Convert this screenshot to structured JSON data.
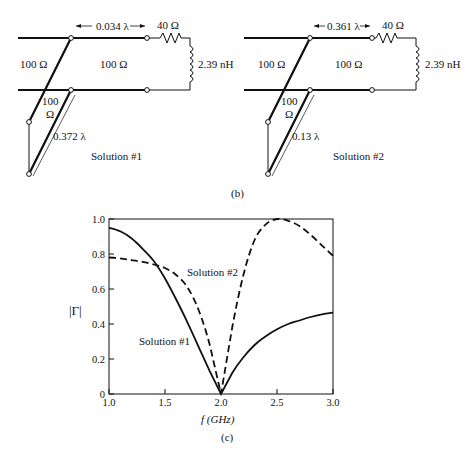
{
  "panel_b": {
    "caption": "(b)",
    "solutions": [
      {
        "label": "Solution #1",
        "line_impedance_left": "100 Ω",
        "line_impedance_right": "100 Ω",
        "stub_impedance_top": "100",
        "stub_impedance_bottom": "Ω",
        "series_length": "0.034 λ",
        "stub_length": "0.372 λ",
        "load_resistance": "40 Ω",
        "load_inductance": "2.39 nH"
      },
      {
        "label": "Solution #2",
        "line_impedance_left": "100 Ω",
        "line_impedance_right": "100 Ω",
        "stub_impedance_top": "100",
        "stub_impedance_bottom": "Ω",
        "series_length": "0.361 λ",
        "stub_length": "0.13 λ",
        "load_resistance": "40 Ω",
        "load_inductance": "2.39 nH"
      }
    ]
  },
  "panel_c": {
    "caption": "(c)",
    "ylabel": "|Γ|",
    "xlabel": "f (GHz)",
    "annotations": [
      "Solution #2",
      "Solution #1"
    ],
    "xticks": [
      "1.0",
      "1.5",
      "2.0",
      "2.5",
      "3.0"
    ],
    "yticks": [
      "0",
      "0.2",
      "0.4",
      "0.6",
      "0.8",
      "1.0"
    ]
  },
  "chart_data": {
    "type": "line",
    "title": "",
    "xlabel": "f (GHz)",
    "ylabel": "|Γ|",
    "xlim": [
      1.0,
      3.0
    ],
    "ylim": [
      0,
      1.0
    ],
    "grid": false,
    "legend": "inline annotations",
    "x": [
      1.0,
      1.1,
      1.2,
      1.3,
      1.4,
      1.5,
      1.6,
      1.7,
      1.8,
      1.9,
      2.0,
      2.1,
      2.2,
      2.3,
      2.4,
      2.5,
      2.6,
      2.7,
      2.8,
      2.9,
      3.0
    ],
    "series": [
      {
        "name": "Solution #1",
        "style": "solid",
        "values": [
          0.95,
          0.93,
          0.89,
          0.83,
          0.76,
          0.66,
          0.54,
          0.41,
          0.27,
          0.13,
          0.0,
          0.12,
          0.21,
          0.28,
          0.33,
          0.37,
          0.4,
          0.42,
          0.44,
          0.455,
          0.465
        ]
      },
      {
        "name": "Solution #2",
        "style": "dashed",
        "values": [
          0.78,
          0.775,
          0.765,
          0.755,
          0.74,
          0.72,
          0.68,
          0.61,
          0.48,
          0.28,
          0.0,
          0.38,
          0.68,
          0.88,
          0.97,
          1.0,
          0.99,
          0.96,
          0.91,
          0.85,
          0.79
        ]
      }
    ]
  }
}
